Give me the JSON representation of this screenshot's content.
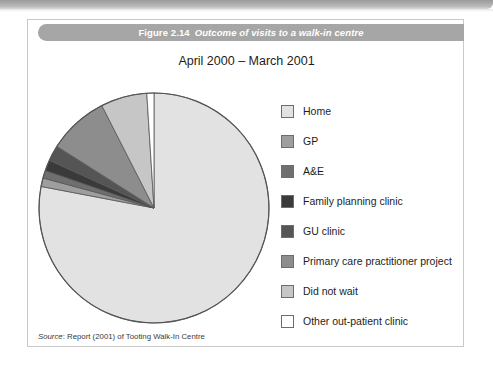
{
  "figure": {
    "caption_number": "Figure 2.14",
    "caption_title": "Outcome of visits to a walk-in centre",
    "subtitle": "April 2000 – March 2001",
    "source_prefix": "Source",
    "source_text": ": Report (2001) of Tooting Walk-In Centre"
  },
  "colors": {
    "caption_bar": "#a6a6a6",
    "card_border": "#c9c9c9",
    "slice_outline": "#555555",
    "page_background": "#ffffff"
  },
  "chart_data": {
    "type": "pie",
    "subtitle": "April 2000 – March 2001",
    "xlabel": "",
    "ylabel": "",
    "legend_position": "right",
    "start_angle_deg": 0,
    "direction": "clockwise",
    "categories": [
      "Home",
      "GP",
      "A&E",
      "Family planning clinic",
      "GU clinic",
      "Primary care practitioner project",
      "Did not wait",
      "Other out-patient clinic"
    ],
    "values": [
      78,
      1.2,
      1.1,
      1.5,
      2.2,
      8.5,
      6.5,
      1.0
    ],
    "value_unit": "percent",
    "colors": [
      "#e2e2e2",
      "#9e9e9e",
      "#6f6f6f",
      "#3a3a3a",
      "#555555",
      "#8d8d8d",
      "#c6c6c6",
      "#ffffff"
    ]
  },
  "legend": {
    "items": [
      {
        "label": "Home",
        "color": "#e2e2e2"
      },
      {
        "label": "GP",
        "color": "#9e9e9e"
      },
      {
        "label": "A&E",
        "color": "#6f6f6f"
      },
      {
        "label": "Family planning clinic",
        "color": "#3a3a3a"
      },
      {
        "label": "GU clinic",
        "color": "#555555"
      },
      {
        "label": "Primary care practitioner project",
        "color": "#8d8d8d"
      },
      {
        "label": "Did not wait",
        "color": "#c6c6c6"
      },
      {
        "label": "Other out-patient clinic",
        "color": "#ffffff"
      }
    ]
  }
}
